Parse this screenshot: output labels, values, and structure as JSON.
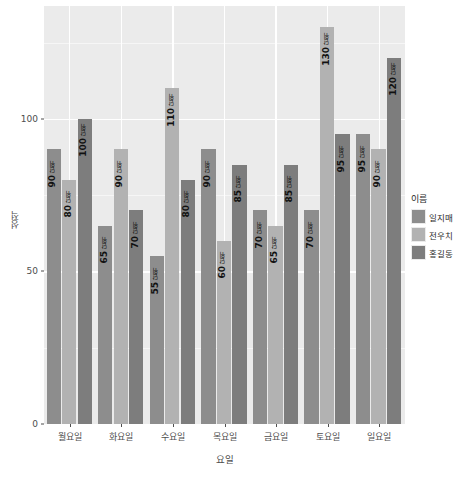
{
  "chart_data": {
    "type": "bar",
    "title": "",
    "subtitle": "",
    "xlabel": "요일",
    "ylabel": "성적",
    "categories": [
      "월요일",
      "화요일",
      "수요일",
      "목요일",
      "금요일",
      "토요일",
      "일요일"
    ],
    "series": [
      {
        "name": "일지매",
        "color": "#8d8d8d",
        "values": [
          90,
          65,
          55,
          90,
          70,
          70,
          95
        ]
      },
      {
        "name": "전우치",
        "color": "#b2b2b2",
        "values": [
          80,
          90,
          110,
          60,
          65,
          130,
          90
        ]
      },
      {
        "name": "홍길동",
        "color": "#7d7d7d",
        "values": [
          100,
          70,
          80,
          85,
          85,
          95,
          120
        ]
      }
    ],
    "ylim": [
      0,
      137
    ],
    "yticks": [
      0,
      50,
      100
    ],
    "yticklabels": [
      "0",
      "50",
      "100"
    ],
    "y_minor_gridlines": [
      25,
      75,
      125
    ],
    "grid": true,
    "legend_position": "right",
    "legend_title": "이름",
    "bar_value_unit": "단위",
    "panel_background": "#ebebeb",
    "gridline_color": "#ffffff",
    "axis_text_color": "#4d4d4d",
    "data_labels": [
      {
        "category": "월요일",
        "series": "일지매",
        "value": 90,
        "text": "90",
        "unit": "단위"
      },
      {
        "category": "월요일",
        "series": "전우치",
        "value": 80,
        "text": "80",
        "unit": "단위"
      },
      {
        "category": "월요일",
        "series": "홍길동",
        "value": 100,
        "text": "100",
        "unit": "단위"
      },
      {
        "category": "화요일",
        "series": "일지매",
        "value": 65,
        "text": "65",
        "unit": "단위"
      },
      {
        "category": "화요일",
        "series": "전우치",
        "value": 90,
        "text": "90",
        "unit": "단위"
      },
      {
        "category": "화요일",
        "series": "홍길동",
        "value": 70,
        "text": "70",
        "unit": "단위"
      },
      {
        "category": "수요일",
        "series": "일지매",
        "value": 55,
        "text": "55",
        "unit": "단위"
      },
      {
        "category": "수요일",
        "series": "전우치",
        "value": 110,
        "text": "110",
        "unit": "단위"
      },
      {
        "category": "수요일",
        "series": "홍길동",
        "value": 80,
        "text": "80",
        "unit": "단위"
      },
      {
        "category": "목요일",
        "series": "일지매",
        "value": 90,
        "text": "90",
        "unit": "단위"
      },
      {
        "category": "목요일",
        "series": "전우치",
        "value": 60,
        "text": "60",
        "unit": "단위"
      },
      {
        "category": "목요일",
        "series": "홍길동",
        "value": 85,
        "text": "85",
        "unit": "단위"
      },
      {
        "category": "금요일",
        "series": "일지매",
        "value": 70,
        "text": "70",
        "unit": "단위"
      },
      {
        "category": "금요일",
        "series": "전우치",
        "value": 65,
        "text": "65",
        "unit": "단위"
      },
      {
        "category": "금요일",
        "series": "홍길동",
        "value": 85,
        "text": "85",
        "unit": "단위"
      },
      {
        "category": "토요일",
        "series": "일지매",
        "value": 70,
        "text": "70",
        "unit": "단위"
      },
      {
        "category": "토요일",
        "series": "전우치",
        "value": 130,
        "text": "130",
        "unit": "단위"
      },
      {
        "category": "토요일",
        "series": "홍길동",
        "value": 95,
        "text": "95",
        "unit": "단위"
      },
      {
        "category": "일요일",
        "series": "일지매",
        "value": 95,
        "text": "95",
        "unit": "단위"
      },
      {
        "category": "일요일",
        "series": "전우치",
        "value": 90,
        "text": "90",
        "unit": "단위"
      },
      {
        "category": "일요일",
        "series": "홍길동",
        "value": 120,
        "text": "120",
        "unit": "단위"
      }
    ]
  }
}
